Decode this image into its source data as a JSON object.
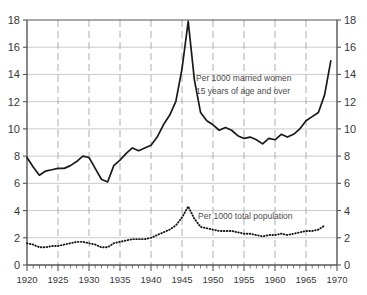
{
  "chart_data": {
    "type": "line",
    "title": "",
    "xlabel": "",
    "ylabel": "",
    "xlim": [
      1920,
      1970
    ],
    "ylim": [
      0,
      18
    ],
    "grid": true,
    "legend_position": "inline-annotations",
    "y_ticks": [
      0,
      2,
      4,
      6,
      8,
      10,
      12,
      14,
      16,
      18
    ],
    "y_ticks_right": [
      0,
      2,
      4,
      6,
      8,
      10,
      12,
      14,
      16,
      18
    ],
    "x_ticks": [
      1920,
      1925,
      1930,
      1935,
      1940,
      1945,
      1950,
      1955,
      1960,
      1965,
      1970
    ],
    "x_minor_tick_step": 1,
    "series": [
      {
        "name": "Per 1000 married women 15 years of age and over",
        "style": "solid",
        "color": "#1a1a1a",
        "x": [
          1920,
          1921,
          1922,
          1923,
          1924,
          1925,
          1926,
          1927,
          1928,
          1929,
          1930,
          1931,
          1932,
          1933,
          1934,
          1935,
          1936,
          1937,
          1938,
          1939,
          1940,
          1941,
          1942,
          1943,
          1944,
          1945,
          1946,
          1947,
          1948,
          1949,
          1950,
          1951,
          1952,
          1953,
          1954,
          1955,
          1956,
          1957,
          1958,
          1959,
          1960,
          1961,
          1962,
          1963,
          1964,
          1965,
          1966,
          1967,
          1968,
          1969
        ],
        "values": [
          7.9,
          7.2,
          6.6,
          6.9,
          7.0,
          7.1,
          7.1,
          7.3,
          7.6,
          8.0,
          7.9,
          7.1,
          6.3,
          6.1,
          7.3,
          7.7,
          8.2,
          8.6,
          8.4,
          8.6,
          8.8,
          9.4,
          10.3,
          11.0,
          12.0,
          14.4,
          17.9,
          13.6,
          11.2,
          10.6,
          10.3,
          9.9,
          10.1,
          9.9,
          9.5,
          9.3,
          9.4,
          9.2,
          8.9,
          9.3,
          9.2,
          9.6,
          9.4,
          9.6,
          10.0,
          10.6,
          10.9,
          11.2,
          12.5,
          15.0
        ]
      },
      {
        "name": "Per 1000 total population",
        "style": "dotted",
        "color": "#1a1a1a",
        "x": [
          1920,
          1921,
          1922,
          1923,
          1924,
          1925,
          1926,
          1927,
          1928,
          1929,
          1930,
          1931,
          1932,
          1933,
          1934,
          1935,
          1936,
          1937,
          1938,
          1939,
          1940,
          1941,
          1942,
          1943,
          1944,
          1945,
          1946,
          1947,
          1948,
          1949,
          1950,
          1951,
          1952,
          1953,
          1954,
          1955,
          1956,
          1957,
          1958,
          1959,
          1960,
          1961,
          1962,
          1963,
          1964,
          1965,
          1966,
          1967,
          1968
        ],
        "values": [
          1.6,
          1.5,
          1.3,
          1.3,
          1.4,
          1.4,
          1.5,
          1.6,
          1.7,
          1.7,
          1.6,
          1.5,
          1.3,
          1.3,
          1.6,
          1.7,
          1.8,
          1.9,
          1.9,
          1.9,
          2.0,
          2.2,
          2.4,
          2.6,
          2.9,
          3.5,
          4.3,
          3.4,
          2.8,
          2.7,
          2.6,
          2.5,
          2.5,
          2.5,
          2.4,
          2.3,
          2.3,
          2.2,
          2.1,
          2.2,
          2.2,
          2.3,
          2.2,
          2.3,
          2.4,
          2.5,
          2.5,
          2.6,
          2.9
        ]
      }
    ],
    "annotations": [
      {
        "id": "annotation-married-women",
        "lines": [
          "Per 1000 married women",
          "15 years of age and over"
        ],
        "x": 1948,
        "y": 13.7
      },
      {
        "id": "annotation-total-population",
        "lines": [
          "Per 1000 total population"
        ],
        "x": 1948.5,
        "y": 3.5
      }
    ]
  },
  "axes": {
    "left_labels": [
      "18",
      "16",
      "14",
      "12",
      "10",
      "8",
      "6",
      "4",
      "2",
      "0"
    ],
    "right_labels": [
      "18",
      "16",
      "14",
      "12",
      "10",
      "8",
      "6",
      "4",
      "2",
      "0"
    ],
    "bottom_labels": [
      "1920",
      "1925",
      "1930",
      "1935",
      "1940",
      "1945",
      "1950",
      "1955",
      "1960",
      "1965",
      "1970"
    ]
  },
  "annotation_text": {
    "married_line1": "Per 1000 married women",
    "married_line2": "15 years of age and over",
    "population_line1": "Per 1000 total population"
  },
  "colors": {
    "background": "#ffffff",
    "line": "#1a1a1a",
    "axis": "#555555",
    "grid_horizontal": "#bdbdbd",
    "grid_vertical": "#9a9a9a",
    "text": "#3a3a3a",
    "annotation": "#4a4a4a"
  }
}
